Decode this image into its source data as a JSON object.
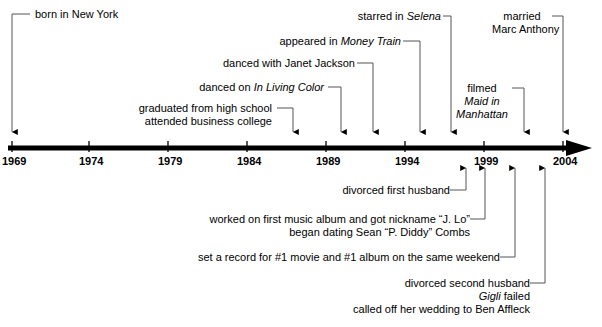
{
  "figure": {
    "type": "timeline",
    "axis": {
      "start_year": 1969,
      "end_year": 2004,
      "tick_years": [
        "1969",
        "1974",
        "1979",
        "1984",
        "1989",
        "1994",
        "1999",
        "2004"
      ],
      "axis_color": "#000000",
      "arrow_direction": "right"
    },
    "events_above": [
      {
        "id": "born",
        "lines": [
          {
            "text": "born in New York",
            "italic": false
          }
        ],
        "year": 1969,
        "connector": "elbow-left"
      },
      {
        "id": "graduated",
        "lines": [
          {
            "text": "graduated from high school",
            "italic": false
          },
          {
            "text": "attended business college",
            "italic": false
          }
        ],
        "year": 1987,
        "connector": "elbow-right"
      },
      {
        "id": "in-living-color",
        "lines": [
          {
            "text": "danced on ",
            "italic": false
          },
          {
            "text": "In Living Color",
            "italic": true
          }
        ],
        "year": 1990,
        "connector": "elbow-right"
      },
      {
        "id": "janet-jackson",
        "lines": [
          {
            "text": "danced with Janet Jackson",
            "italic": false
          }
        ],
        "year": 1992,
        "connector": "elbow-right"
      },
      {
        "id": "money-train",
        "lines": [
          {
            "text": "appeared in ",
            "italic": false
          },
          {
            "text": "Money Train",
            "italic": true
          }
        ],
        "year": 1995,
        "connector": "elbow-right"
      },
      {
        "id": "selena",
        "lines": [
          {
            "text": "starred in ",
            "italic": false
          },
          {
            "text": "Selena",
            "italic": true
          }
        ],
        "year": 1997,
        "connector": "elbow-right"
      },
      {
        "id": "maid-in-manhattan",
        "lines": [
          {
            "text": "filmed",
            "italic": false
          },
          {
            "text": "Maid in",
            "italic": true
          },
          {
            "text": "Manhattan",
            "italic": true
          }
        ],
        "year": 2001,
        "connector": "elbow-right"
      },
      {
        "id": "married-marc-anthony",
        "lines": [
          {
            "text": "married",
            "italic": false
          },
          {
            "text": "Marc Anthony",
            "italic": false
          }
        ],
        "year": 2004,
        "connector": "elbow-right"
      }
    ],
    "events_below": [
      {
        "id": "divorced-first-husband",
        "lines": [
          {
            "text": "divorced first husband",
            "italic": false
          }
        ],
        "connector": "elbow-right"
      },
      {
        "id": "first-album-jlo",
        "lines": [
          {
            "text": "worked on first music album and got nickname “J. Lo”",
            "italic": false
          },
          {
            "text": "began dating Sean “P. Diddy” Combs",
            "italic": false
          }
        ],
        "connector": "elbow-right"
      },
      {
        "id": "record-movie-album",
        "lines": [
          {
            "text": "set a record for #1 movie and #1 album on the same weekend",
            "italic": false
          }
        ],
        "connector": "elbow-right"
      },
      {
        "id": "divorced-second-husband",
        "lines": [
          {
            "text": "divorced second husband",
            "italic": false
          },
          {
            "text": "Gigli",
            "italic": true
          },
          {
            "text": " failed",
            "italic": false
          },
          {
            "text": "called off her wedding to Ben Affleck",
            "italic": false
          }
        ],
        "connector": "elbow-right"
      }
    ],
    "text_fragments": {
      "born_in_new_york": "born in New York",
      "graduated_high_school": "graduated from high school",
      "attended_business_college": "attended business college",
      "danced_on": "danced on",
      "in_living_color": "In Living Color",
      "danced_with_janet_jackson": "danced with Janet Jackson",
      "appeared_in": "appeared in",
      "money_train": "Money Train",
      "starred_in": "starred in",
      "selena": "Selena",
      "filmed": "filmed",
      "maid_in": "Maid in",
      "manhattan": "Manhattan",
      "married": "married",
      "marc_anthony": "Marc Anthony",
      "divorced_first_husband": "divorced first husband",
      "worked_first_album": "worked on first music album and got nickname “J. Lo”",
      "began_dating_diddy": "began dating Sean “P. Diddy” Combs",
      "set_a_record": "set a record for #1 movie and #1 album on the same weekend",
      "divorced_second_husband": "divorced second husband",
      "gigli": "Gigli",
      "failed": "failed",
      "called_off_wedding": "called off her wedding to Ben Affleck"
    },
    "years": {
      "y1969": "1969",
      "y1974": "1974",
      "y1979": "1979",
      "y1984": "1984",
      "y1989": "1989",
      "y1994": "1994",
      "y1999": "1999",
      "y2004": "2004"
    }
  }
}
